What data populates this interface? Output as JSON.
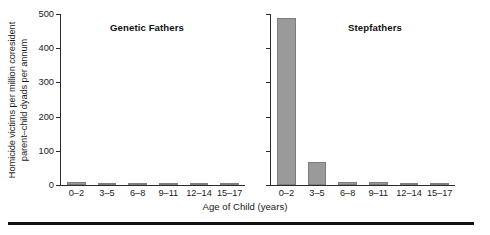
{
  "figure": {
    "y_axis_title_line1": "Homicide victims per million coresident",
    "y_axis_title_line2": "parent–child dyads per annum",
    "x_axis_title": "Age of Child (years)",
    "bar_color": "#9a9a9a",
    "axis_color": "#2b2b2b",
    "rule_color": "#111111"
  },
  "chart_data": {
    "type": "bar",
    "title": "",
    "xlabel": "Age of Child (years)",
    "ylabel": "Homicide victims per million coresident parent–child dyads per annum",
    "ylim": [
      0,
      500
    ],
    "yticks": [
      0,
      100,
      200,
      300,
      400,
      500
    ],
    "ytick_labels": [
      "0",
      "100",
      "200",
      "300",
      "400",
      "500"
    ],
    "categories": [
      "0–2",
      "3–5",
      "6–8",
      "9–11",
      "12–14",
      "15–17"
    ],
    "grid": false,
    "legend": "none",
    "panels": [
      {
        "title": "Genetic Fathers",
        "values": [
          8,
          6,
          5,
          4,
          4,
          3
        ]
      },
      {
        "title": "Stepfathers",
        "values": [
          487,
          68,
          9,
          9,
          6,
          6
        ]
      }
    ]
  }
}
